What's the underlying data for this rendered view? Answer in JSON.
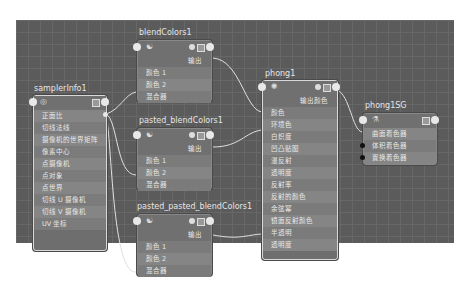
{
  "nodes": {
    "samplerInfo1": {
      "title": "samplerInfo1",
      "rows": [
        "正面比",
        "切线法线",
        "摄像机的世界矩阵",
        "像素中心",
        "点摄像机",
        "点对象",
        "点世界",
        "切线 U 摄像机",
        "切线 V 摄像机",
        "UV 坐标"
      ]
    },
    "blendColors1": {
      "title": "blendColors1",
      "output": "输出",
      "rows": [
        "颜色 1",
        "颜色 2",
        "混合器"
      ]
    },
    "pasted_blendColors1": {
      "title": "pasted_blendColors1",
      "output": "输出",
      "rows": [
        "颜色 1",
        "颜色 2",
        "混合器"
      ]
    },
    "pasted_pasted_blendColors1": {
      "title": "pasted_pasted_blendColors1",
      "output": "输出",
      "rows": [
        "颜色 1",
        "颜色 2",
        "混合器"
      ]
    },
    "phong1": {
      "title": "phong1",
      "output": "输出颜色",
      "rows": [
        "颜色",
        "环境色",
        "白炽度",
        "凹凸贴图",
        "漫反射",
        "透明度",
        "反射率",
        "反射的颜色",
        "余弦幂",
        "镜面反射颜色",
        "半透明",
        "透明度"
      ]
    },
    "phong1SG": {
      "title": "phong1SG",
      "rows": [
        "曲面着色器",
        "体积着色器",
        "置换着色器"
      ]
    }
  },
  "icons": {
    "blend": "swirl-icon",
    "phong": "sun-icon",
    "sg": "shading-group-icon",
    "sampler": "sampler-icon"
  },
  "colors": {
    "canvas": "#5b5b5b",
    "node": "#6e6e6e",
    "wire": "#e0e0e0"
  }
}
